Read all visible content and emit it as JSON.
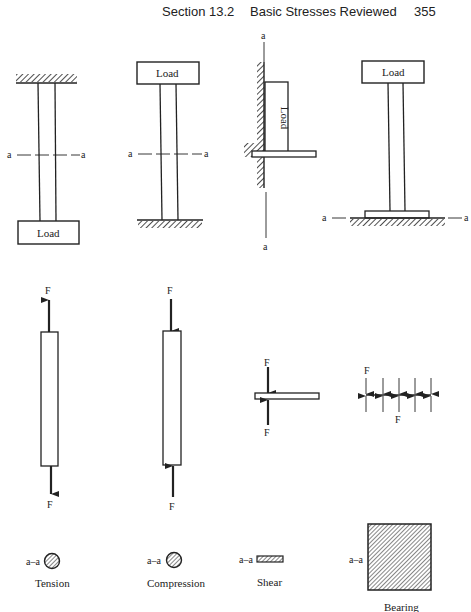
{
  "header": {
    "section": "Section 13.2",
    "title": "Basic Stresses Reviewed",
    "page_number": "355"
  },
  "figure": {
    "section_marker": "a",
    "section_label": "a–a",
    "force_label": "F",
    "load_label": "Load",
    "columns": [
      {
        "case": "tension",
        "caption": "Tension"
      },
      {
        "case": "compression",
        "caption": "Compression"
      },
      {
        "case": "shear",
        "caption": "Shear"
      },
      {
        "case": "bearing",
        "caption": "Bearing"
      }
    ]
  }
}
